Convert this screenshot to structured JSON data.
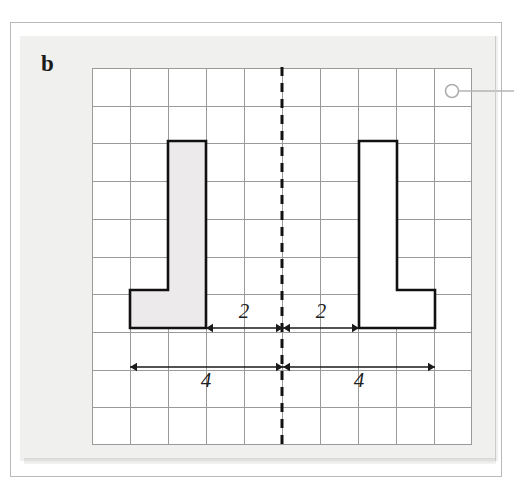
{
  "page": {
    "part_label": "b",
    "background_color": "#ffffff",
    "panel_color": "#f0f0ee",
    "frame_color": "#b9b9b9"
  },
  "grid": {
    "columns": 10,
    "rows": 10,
    "cell_size_px": 38,
    "line_color": "#9a9a9a",
    "origin_x": 92,
    "origin_y": 68,
    "width": 380,
    "height": 377
  },
  "mirror_line": {
    "name": "line-of-symmetry",
    "orientation": "vertical",
    "style": "dashed",
    "color": "#111111",
    "grid_column": 5
  },
  "shapes": [
    {
      "name": "original-shape",
      "side": "left",
      "fill": "#eceaea",
      "stroke": "#111111",
      "description": "L-shaped hexomino, shaded",
      "points": "130,328 130,290 168,290 168,141 206,141 206,328"
    },
    {
      "name": "reflected-shape",
      "side": "right",
      "fill": "#ffffff",
      "stroke": "#111111",
      "description": "mirror image of original shape, unshaded",
      "points": "435,328 435,290 397,290 397,141 359,141 359,328"
    }
  ],
  "dimensions": [
    {
      "name": "dim-left-inner",
      "label": "2",
      "value": 2,
      "y": 328,
      "from_x": 206,
      "to_x": 283,
      "label_x": 244,
      "label_y": 318
    },
    {
      "name": "dim-right-inner",
      "label": "2",
      "value": 2,
      "y": 328,
      "from_x": 283,
      "to_x": 359,
      "label_x": 321,
      "label_y": 318
    },
    {
      "name": "dim-left-outer",
      "label": "4",
      "value": 4,
      "y": 367,
      "from_x": 130,
      "to_x": 283,
      "label_x": 206,
      "label_y": 387
    },
    {
      "name": "dim-right-outer",
      "label": "4",
      "value": 4,
      "y": 367,
      "from_x": 283,
      "to_x": 435,
      "label_x": 359,
      "label_y": 387
    }
  ],
  "marker": {
    "name": "hole-punch-marker",
    "shape": "circle-with-leader-line",
    "color": "#b0b0b0"
  }
}
